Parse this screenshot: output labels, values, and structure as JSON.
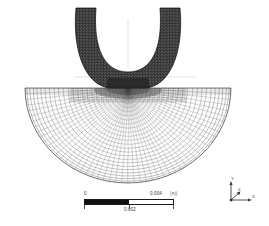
{
  "view": {
    "title": "Finite element mesh of indenter and substrate",
    "background_color": "#ffffff",
    "mesh_line_color": "#3f3f3f",
    "indenter_fill_color": "#2b2b2b"
  },
  "scalebar": {
    "name": "scale-bar",
    "min_label": "0",
    "mid_label": "0.002",
    "max_label": "0.004",
    "unit_label": "(m)",
    "fill_color": "#111111",
    "empty_color": "#ffffff",
    "length_value": 0.004
  },
  "axis_triad": {
    "name": "axis-triad",
    "x_label": "X",
    "y_label": "Y",
    "z_label": "Z",
    "color": "#4a4a4a"
  },
  "chart_data": {
    "type": "mesh-plot",
    "xlabel": "",
    "ylabel": "",
    "grid": false,
    "legend_position": "none",
    "annotations": [
      "0",
      "0.002",
      "0.004",
      "(m)",
      "X",
      "Y",
      "Z"
    ],
    "scale_units": "m",
    "scale_range": [
      0,
      0.004
    ],
    "bodies": [
      {
        "name": "indenter",
        "shape": "horseshoe-arch",
        "fill": "#2b2b2b",
        "mesh": "fine-dark",
        "center_x": 128,
        "outer_radius_x": 52,
        "outer_radius_y": 62,
        "inner_radius_x": 32,
        "inner_radius_y": 42,
        "top_y": 8,
        "base_y": 88
      },
      {
        "name": "substrate",
        "shape": "half-disc",
        "fill": "#ffffff",
        "mesh": "structured-quad",
        "center_x": 128,
        "top_y": 88,
        "radius_x": 103,
        "radius_y": 95,
        "radial_divisions": 26,
        "angular_divisions": 52
      }
    ],
    "reference_lines": [
      {
        "name": "vertical-symmetry-axis",
        "x": 128,
        "y0": 20,
        "y1": 92
      },
      {
        "name": "horizontal-reference",
        "y": 77,
        "x0": 74,
        "x1": 196
      }
    ]
  }
}
